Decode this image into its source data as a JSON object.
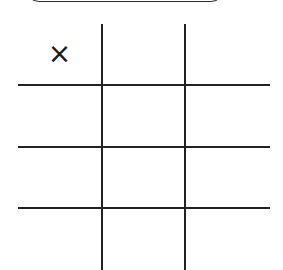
{
  "game": {
    "type": "tic-tac-toe",
    "line_color": "#222222",
    "cells": [
      [
        "×",
        "",
        ""
      ],
      [
        "",
        "",
        ""
      ],
      [
        "",
        "",
        ""
      ],
      [
        "",
        "",
        ""
      ]
    ]
  }
}
